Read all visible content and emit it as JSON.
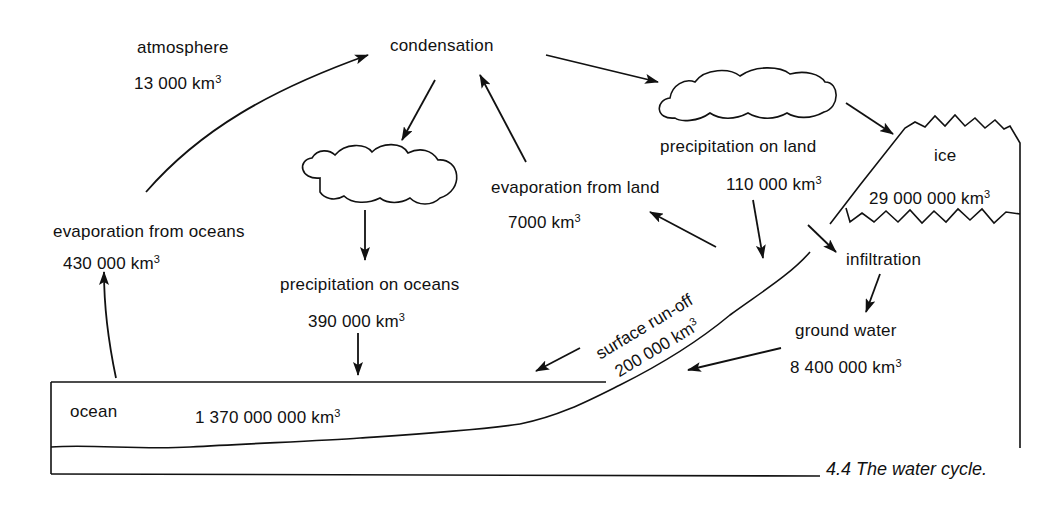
{
  "diagram": {
    "title": "4.4  The water cycle.",
    "unit_suffix": "3",
    "colors": {
      "ink": "#111111",
      "paper": "#ffffff"
    },
    "reservoirs": {
      "atmosphere": {
        "label": "atmosphere",
        "value": "13 000 km"
      },
      "ocean": {
        "label": "ocean",
        "value": "1 370 000 000 km"
      },
      "ice": {
        "label": "ice",
        "value": "29 000 000 km"
      },
      "ground_water": {
        "label": "ground water",
        "value": "8 400 000 km"
      }
    },
    "processes": {
      "condensation": {
        "label": "condensation"
      },
      "evaporation_oceans": {
        "label": "evaporation from oceans",
        "value": "430 000 km"
      },
      "precipitation_oceans": {
        "label": "precipitation on oceans",
        "value": "390 000 km"
      },
      "evaporation_land": {
        "label": "evaporation from land",
        "value": "7000 km"
      },
      "precipitation_land": {
        "label": "precipitation on land",
        "value": "110 000 km"
      },
      "infiltration": {
        "label": "infiltration"
      },
      "surface_runoff": {
        "label": "surface run-off",
        "value": "200 000 km"
      }
    },
    "icons": {
      "cloud_ocean": "cloud-icon",
      "cloud_land": "cloud-icon",
      "ice_mass": "ice-mountain-icon"
    }
  }
}
